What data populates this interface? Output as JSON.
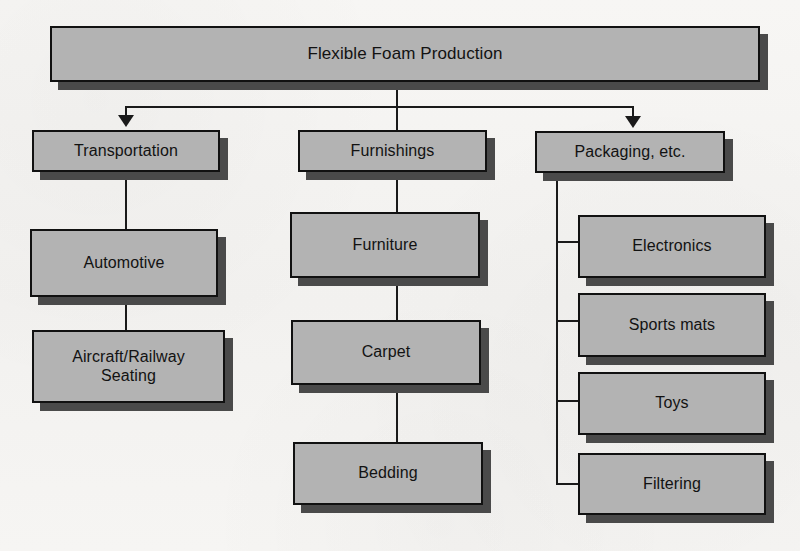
{
  "diagram": {
    "title": "Flexible Foam Production",
    "type": "hierarchy-flowchart",
    "colors": {
      "node_fill": "#b3b3b3",
      "node_border": "#111111",
      "shadow": "#4a4a4a",
      "background": "#f4f3f1",
      "text": "#121212",
      "connector": "#1a1a1a"
    },
    "root": {
      "label": "Flexible Foam Production"
    },
    "branches": [
      {
        "id": "transportation",
        "label": "Transportation",
        "connector": "arrow",
        "children": [
          {
            "id": "automotive",
            "label": "Automotive",
            "connector": "line"
          },
          {
            "id": "aircraft-railway-seating",
            "label": "Aircraft/Railway\nSeating",
            "connector": "line"
          }
        ]
      },
      {
        "id": "furnishings",
        "label": "Furnishings",
        "connector": "line",
        "children": [
          {
            "id": "furniture",
            "label": "Furniture",
            "connector": "line"
          },
          {
            "id": "carpet",
            "label": "Carpet",
            "connector": "line"
          },
          {
            "id": "bedding",
            "label": "Bedding",
            "connector": "line"
          }
        ]
      },
      {
        "id": "packaging",
        "label": "Packaging, etc.",
        "connector": "arrow",
        "children": [
          {
            "id": "electronics",
            "label": "Electronics",
            "connector": "spine"
          },
          {
            "id": "sports-mats",
            "label": "Sports mats",
            "connector": "spine"
          },
          {
            "id": "toys",
            "label": "Toys",
            "connector": "spine"
          },
          {
            "id": "filtering",
            "label": "Filtering",
            "connector": "spine"
          }
        ]
      }
    ]
  }
}
